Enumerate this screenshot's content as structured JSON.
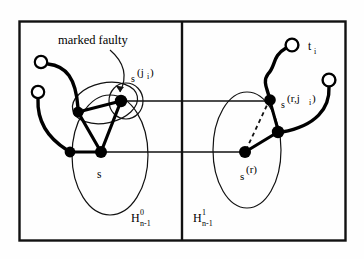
{
  "figure": {
    "kind": "graph-diagram",
    "frame": {
      "outer_border_color": "#111111",
      "divider_color": "#111111"
    },
    "annotations": {
      "marked_faulty": "marked faulty"
    },
    "labels": {
      "s": "s",
      "s_ji_base": "s",
      "s_ji_sup": "(j",
      "s_ji_sup_sub": "i",
      "s_ji_sup_close": ")",
      "s_r_base": "s",
      "s_r_sup": "(r)",
      "s_rji_base": "s",
      "s_rji_sup_pre": "(r,j",
      "s_rji_sup_sub": "i",
      "s_rji_sup_close": ")",
      "t_base": "t",
      "t_sub": "i"
    },
    "partitions": [
      {
        "id": "left",
        "base": "H",
        "superscript": "0",
        "subscript": "n-1"
      },
      {
        "id": "right",
        "base": "H",
        "superscript": "1",
        "subscript": "n-1"
      }
    ],
    "colors": {
      "ink": "#000000",
      "node_fill": "#000000",
      "open_node_fill": "#ffffff",
      "paper": "#ffffff"
    },
    "nodes": [
      {
        "name": "open-node-top-left",
        "x": 41,
        "y": 62,
        "type": "open"
      },
      {
        "name": "open-node-lower-left",
        "x": 38,
        "y": 92,
        "type": "open"
      },
      {
        "name": "filled-node-left-mid",
        "x": 78,
        "y": 112,
        "type": "filled"
      },
      {
        "name": "filled-node-left-low",
        "x": 70,
        "y": 152,
        "type": "filled"
      },
      {
        "name": "filled-node-s",
        "x": 101,
        "y": 152,
        "type": "filled",
        "label": "s"
      },
      {
        "name": "filled-node-s-ji",
        "x": 121,
        "y": 100,
        "type": "filled",
        "label": "s^(j_i)"
      },
      {
        "name": "filled-node-s-rji",
        "x": 270,
        "y": 100,
        "type": "filled",
        "label": "s^(r,j_i)"
      },
      {
        "name": "filled-node-s-r",
        "x": 245,
        "y": 152,
        "type": "filled",
        "label": "s^(r)"
      },
      {
        "name": "filled-node-right-mid",
        "x": 278,
        "y": 132,
        "type": "filled"
      },
      {
        "name": "open-node-t-i",
        "x": 292,
        "y": 45,
        "type": "open",
        "label": "t_i"
      },
      {
        "name": "open-node-far-right",
        "x": 329,
        "y": 80,
        "type": "open"
      }
    ],
    "edges": [
      {
        "name": "cross-edge-upper",
        "style": "thin-solid",
        "from": "filled-node-s-ji",
        "to": "filled-node-s-rji"
      },
      {
        "name": "cross-edge-lower",
        "style": "thin-solid",
        "from": "filled-node-s",
        "to": "filled-node-s-r"
      },
      {
        "name": "dashed-edge-right",
        "style": "dashed",
        "from": "filled-node-s-r",
        "to": "filled-node-s-rji"
      }
    ]
  }
}
